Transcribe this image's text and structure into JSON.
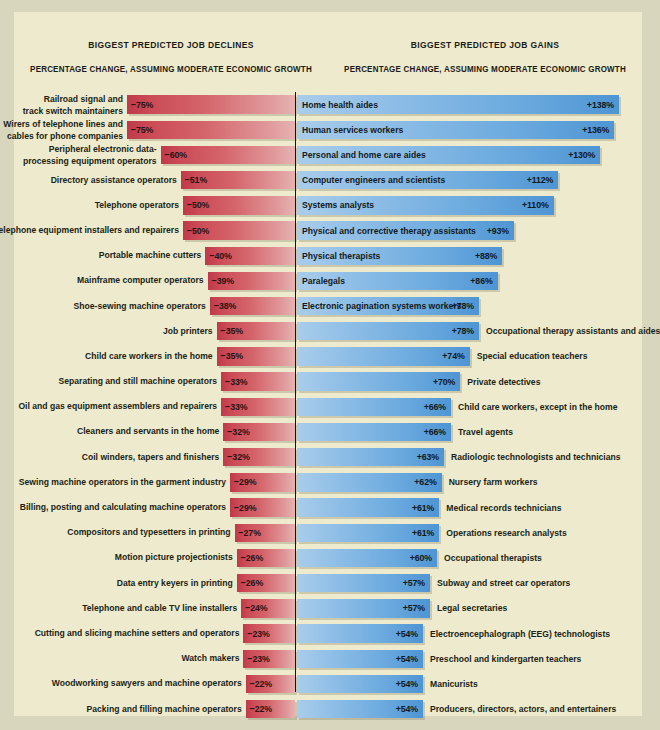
{
  "headers": {
    "left_title": "BIGGEST PREDICTED JOB DECLINES",
    "right_title": "BIGGEST PREDICTED JOB GAINS",
    "left_subtitle": "PERCENTAGE CHANGE, ASSUMING MODERATE ECONOMIC GROWTH",
    "right_subtitle": "PERCENTAGE CHANGE, ASSUMING MODERATE ECONOMIC GROWTH"
  },
  "colors": {
    "background_outer": "#d8d6bc",
    "background_panel": "#eeeacd",
    "decline_bar": "#cb4b56",
    "gain_bar": "#6aa9de",
    "divider": "#15150f",
    "text": "#201f16"
  },
  "chart_data": {
    "type": "bar",
    "subtitle": "PERCENTAGE CHANGE, ASSUMING MODERATE ECONOMIC GROWTH",
    "xlabel": "Percentage change",
    "ylabel": "",
    "grid": false,
    "legend": "none",
    "orientation": "horizontal",
    "xlim": [
      -140,
      140
    ],
    "series": [
      {
        "name": "BIGGEST PREDICTED JOB DECLINES",
        "color": "#cb4b56",
        "categories": [
          "Railroad signal and track switch maintainers",
          "Wirers of telephone lines and cables for phone companies",
          "Peripheral electronic data-processing equipment operators",
          "Directory assistance operators",
          "Telephone operators",
          "Telephone equipment installers and repairers",
          "Portable machine cutters",
          "Mainframe computer operators",
          "Shoe-sewing machine operators",
          "Job printers",
          "Child care workers in the home",
          "Separating and still machine operators",
          "Oil and gas equipment assemblers and repairers",
          "Cleaners and servants in the home",
          "Coil winders, tapers and finishers",
          "Sewing machine operators in the garment industry",
          "Billing, posting and calculating machine operators",
          "Compositors and typesetters in printing",
          "Motion picture projectionists",
          "Data entry keyers in printing",
          "Telephone and cable TV line installers",
          "Cutting and slicing machine setters and operators",
          "Watch makers",
          "Woodworking sawyers and machine operators",
          "Packing and filling machine operators"
        ],
        "values": [
          -75,
          -75,
          -60,
          -51,
          -50,
          -50,
          -40,
          -39,
          -38,
          -35,
          -35,
          -33,
          -33,
          -32,
          -32,
          -29,
          -29,
          -27,
          -26,
          -26,
          -24,
          -23,
          -23,
          -22,
          -22
        ],
        "value_labels": [
          "−75%",
          "−75%",
          "−60%",
          "−51%",
          "−50%",
          "−50%",
          "−40%",
          "−39%",
          "−38%",
          "−35%",
          "−35%",
          "−33%",
          "−33%",
          "−32%",
          "−32%",
          "−29%",
          "−29%",
          "−27%",
          "−26%",
          "−26%",
          "−24%",
          "−23%",
          "−23%",
          "−22%",
          "−22%"
        ]
      },
      {
        "name": "BIGGEST PREDICTED JOB GAINS",
        "color": "#6aa9de",
        "categories": [
          "Home health aides",
          "Human services workers",
          "Personal and home care aides",
          "Computer engineers and scientists",
          "Systems analysts",
          "Physical and corrective therapy assistants",
          "Physical therapists",
          "Paralegals",
          "Electronic pagination systems workers",
          "Occupational therapy assistants and aides",
          "Special education teachers",
          "Private detectives",
          "Child care workers, except in the home",
          "Travel agents",
          "Radiologic technologists and technicians",
          "Nursery farm workers",
          "Medical records technicians",
          "Operations research analysts",
          "Occupational therapists",
          "Subway and street car operators",
          "Legal secretaries",
          "Electroencephalograph (EEG) technologists",
          "Preschool and kindergarten teachers",
          "Manicurists",
          "Producers, directors, actors, and entertainers"
        ],
        "values": [
          138,
          136,
          130,
          112,
          110,
          93,
          88,
          86,
          78,
          78,
          74,
          70,
          66,
          66,
          63,
          62,
          61,
          61,
          60,
          57,
          57,
          54,
          54,
          54,
          54
        ],
        "value_labels": [
          "+138%",
          "+136%",
          "+130%",
          "+112%",
          "+110%",
          "+93%",
          "+88%",
          "+86%",
          "+78%",
          "+78%",
          "+74%",
          "+70%",
          "+66%",
          "+66%",
          "+63%",
          "+62%",
          "+61%",
          "+61%",
          "+60%",
          "+57%",
          "+57%",
          "+54%",
          "+54%",
          "+54%",
          "+54%"
        ]
      }
    ]
  },
  "declines": [
    {
      "label_lines": [
        "Railroad signal and",
        "track switch maintainers"
      ],
      "value": -75,
      "value_label": "−75%"
    },
    {
      "label_lines": [
        "Wirers of telephone lines and",
        "cables for phone companies"
      ],
      "value": -75,
      "value_label": "−75%"
    },
    {
      "label_lines": [
        "Peripheral electronic data-",
        "processing equipment operators"
      ],
      "value": -60,
      "value_label": "−60%"
    },
    {
      "label_lines": [
        "Directory assistance operators"
      ],
      "value": -51,
      "value_label": "−51%"
    },
    {
      "label_lines": [
        "Telephone operators"
      ],
      "value": -50,
      "value_label": "−50%"
    },
    {
      "label_lines": [
        "Telephone equipment installers and repairers"
      ],
      "value": -50,
      "value_label": "−50%"
    },
    {
      "label_lines": [
        "Portable machine cutters"
      ],
      "value": -40,
      "value_label": "−40%"
    },
    {
      "label_lines": [
        "Mainframe computer operators"
      ],
      "value": -39,
      "value_label": "−39%"
    },
    {
      "label_lines": [
        "Shoe-sewing machine operators"
      ],
      "value": -38,
      "value_label": "−38%"
    },
    {
      "label_lines": [
        "Job printers"
      ],
      "value": -35,
      "value_label": "−35%"
    },
    {
      "label_lines": [
        "Child care workers in the home"
      ],
      "value": -35,
      "value_label": "−35%"
    },
    {
      "label_lines": [
        "Separating and still machine operators"
      ],
      "value": -33,
      "value_label": "−33%"
    },
    {
      "label_lines": [
        "Oil and gas equipment assemblers and repairers"
      ],
      "value": -33,
      "value_label": "−33%"
    },
    {
      "label_lines": [
        "Cleaners and servants in the home"
      ],
      "value": -32,
      "value_label": "−32%"
    },
    {
      "label_lines": [
        "Coil winders, tapers and finishers"
      ],
      "value": -32,
      "value_label": "−32%"
    },
    {
      "label_lines": [
        "Sewing machine operators in the garment industry"
      ],
      "value": -29,
      "value_label": "−29%"
    },
    {
      "label_lines": [
        "Billing, posting and calculating machine operators"
      ],
      "value": -29,
      "value_label": "−29%"
    },
    {
      "label_lines": [
        "Compositors and typesetters in printing"
      ],
      "value": -27,
      "value_label": "−27%"
    },
    {
      "label_lines": [
        "Motion picture projectionists"
      ],
      "value": -26,
      "value_label": "−26%"
    },
    {
      "label_lines": [
        "Data entry keyers in printing"
      ],
      "value": -26,
      "value_label": "−26%"
    },
    {
      "label_lines": [
        "Telephone and cable TV line installers"
      ],
      "value": -24,
      "value_label": "−24%"
    },
    {
      "label_lines": [
        "Cutting and slicing machine setters and operators"
      ],
      "value": -23,
      "value_label": "−23%"
    },
    {
      "label_lines": [
        "Watch makers"
      ],
      "value": -23,
      "value_label": "−23%"
    },
    {
      "label_lines": [
        "Woodworking sawyers and machine operators"
      ],
      "value": -22,
      "value_label": "−22%"
    },
    {
      "label_lines": [
        "Packing and filling machine operators"
      ],
      "value": -22,
      "value_label": "−22%"
    }
  ],
  "gains": [
    {
      "label": "Home health aides",
      "value": 138,
      "value_label": "+138%",
      "label_inside": true
    },
    {
      "label": "Human services workers",
      "value": 136,
      "value_label": "+136%",
      "label_inside": true
    },
    {
      "label": "Personal and home care aides",
      "value": 130,
      "value_label": "+130%",
      "label_inside": true
    },
    {
      "label": "Computer engineers and scientists",
      "value": 112,
      "value_label": "+112%",
      "label_inside": true
    },
    {
      "label": "Systems analysts",
      "value": 110,
      "value_label": "+110%",
      "label_inside": true
    },
    {
      "label": "Physical and corrective therapy assistants",
      "value": 93,
      "value_label": "+93%",
      "label_inside": true
    },
    {
      "label": "Physical therapists",
      "value": 88,
      "value_label": "+88%",
      "label_inside": true
    },
    {
      "label": "Paralegals",
      "value": 86,
      "value_label": "+86%",
      "label_inside": true
    },
    {
      "label": "Electronic pagination systems workers",
      "value": 78,
      "value_label": "+78%",
      "label_inside": true
    },
    {
      "label": "Occupational therapy assistants and aides",
      "value": 78,
      "value_label": "+78%",
      "label_inside": false
    },
    {
      "label": "Special education teachers",
      "value": 74,
      "value_label": "+74%",
      "label_inside": false
    },
    {
      "label": "Private detectives",
      "value": 70,
      "value_label": "+70%",
      "label_inside": false
    },
    {
      "label": "Child care workers, except in the home",
      "value": 66,
      "value_label": "+66%",
      "label_inside": false
    },
    {
      "label": "Travel agents",
      "value": 66,
      "value_label": "+66%",
      "label_inside": false
    },
    {
      "label": "Radiologic technologists and technicians",
      "value": 63,
      "value_label": "+63%",
      "label_inside": false
    },
    {
      "label": "Nursery farm workers",
      "value": 62,
      "value_label": "+62%",
      "label_inside": false
    },
    {
      "label": "Medical records technicians",
      "value": 61,
      "value_label": "+61%",
      "label_inside": false
    },
    {
      "label": "Operations research analysts",
      "value": 61,
      "value_label": "+61%",
      "label_inside": false
    },
    {
      "label": "Occupational therapists",
      "value": 60,
      "value_label": "+60%",
      "label_inside": false
    },
    {
      "label": "Subway and street car operators",
      "value": 57,
      "value_label": "+57%",
      "label_inside": false
    },
    {
      "label": "Legal secretaries",
      "value": 57,
      "value_label": "+57%",
      "label_inside": false
    },
    {
      "label": "Electroencephalograph (EEG) technologists",
      "value": 54,
      "value_label": "+54%",
      "label_inside": false
    },
    {
      "label": "Preschool and kindergarten teachers",
      "value": 54,
      "value_label": "+54%",
      "label_inside": false
    },
    {
      "label": "Manicurists",
      "value": 54,
      "value_label": "+54%",
      "label_inside": false
    },
    {
      "label": "Producers, directors, actors, and entertainers",
      "value": 54,
      "value_label": "+54%",
      "label_inside": false
    }
  ]
}
